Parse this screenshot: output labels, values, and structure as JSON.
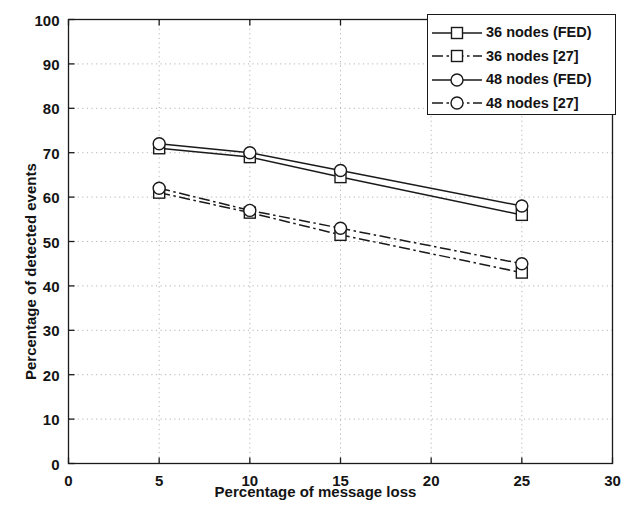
{
  "chart_data": {
    "type": "line",
    "title": "",
    "xlabel": "Percentage of message loss",
    "ylabel": "Percentage of detected events",
    "xlim": [
      0,
      30
    ],
    "ylim": [
      0,
      100
    ],
    "xticks": [
      0,
      5,
      10,
      15,
      20,
      25,
      30
    ],
    "yticks": [
      0,
      10,
      20,
      30,
      40,
      50,
      60,
      70,
      80,
      90,
      100
    ],
    "grid": true,
    "legend_position": "top-right",
    "x": [
      5,
      10,
      15,
      25
    ],
    "series": [
      {
        "name": "36 nodes (FED)",
        "marker": "square",
        "linestyle": "solid",
        "color": "#1a1a1a",
        "values": [
          71,
          69,
          64.5,
          56
        ]
      },
      {
        "name": "36 nodes [27]",
        "marker": "square",
        "linestyle": "dash-dot",
        "color": "#1a1a1a",
        "values": [
          61,
          56.5,
          51.5,
          43
        ]
      },
      {
        "name": "48 nodes (FED)",
        "marker": "circle",
        "linestyle": "solid",
        "color": "#1a1a1a",
        "values": [
          72,
          70,
          66,
          58
        ]
      },
      {
        "name": "48 nodes [27]",
        "marker": "circle",
        "linestyle": "dash-dot",
        "color": "#1a1a1a",
        "values": [
          62,
          57,
          53,
          45
        ]
      }
    ]
  },
  "legend": {
    "entries": [
      {
        "label": "36 nodes (FED)"
      },
      {
        "label": "36 nodes [27]"
      },
      {
        "label": "48 nodes (FED)"
      },
      {
        "label": "48 nodes [27]"
      }
    ]
  },
  "axes": {
    "x_title": "Percentage of message loss",
    "y_title": "Percentage of detected events",
    "x_tick_labels": [
      "0",
      "5",
      "10",
      "15",
      "20",
      "25",
      "30"
    ],
    "y_tick_labels": [
      "0",
      "10",
      "20",
      "30",
      "40",
      "50",
      "60",
      "70",
      "80",
      "90",
      "100"
    ]
  }
}
